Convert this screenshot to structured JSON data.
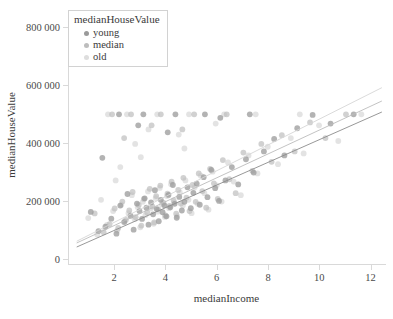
{
  "chart_data": {
    "type": "scatter",
    "title": "",
    "xlabel": "medianIncome",
    "ylabel": "medianHouseValue",
    "xlim": [
      0.2,
      12.6
    ],
    "ylim": [
      -20000,
      860000
    ],
    "xticks": [
      2,
      4,
      6,
      8,
      10,
      12
    ],
    "xticklabels": [
      "2",
      "4",
      "6",
      "8",
      "10",
      "12"
    ],
    "yticks": [
      0,
      200000,
      400000,
      600000,
      800000
    ],
    "yticklabels": [
      "0",
      "200 000",
      "400 000",
      "600 000",
      "800 000"
    ],
    "grid": false,
    "legend": {
      "title": "medianHouseValue",
      "position": "top-left",
      "entries": [
        {
          "label": "young",
          "color": "#9a9a9a"
        },
        {
          "label": "median",
          "color": "#bdbdbd"
        },
        {
          "label": "old",
          "color": "#dedede"
        }
      ]
    },
    "series": [
      {
        "name": "young",
        "color": "#9a9a9a",
        "opacity": 0.75,
        "trendline": {
          "x": [
            0.5,
            12.4
          ],
          "y": [
            42000,
            508000
          ],
          "color": "#8c8c8c"
        },
        "points": [
          [
            1.5,
            350000
          ],
          [
            1.05,
            163000
          ],
          [
            1.35,
            97000
          ],
          [
            1.62,
            112000
          ],
          [
            1.85,
            140000
          ],
          [
            2.05,
            88000
          ],
          [
            2.2,
            185000
          ],
          [
            2.35,
            128000
          ],
          [
            2.48,
            225000
          ],
          [
            2.6,
            150000
          ],
          [
            2.72,
            102000
          ],
          [
            2.85,
            192000
          ],
          [
            2.95,
            166000
          ],
          [
            3.05,
            139000
          ],
          [
            3.15,
            210000
          ],
          [
            3.22,
            178000
          ],
          [
            3.3,
            119000
          ],
          [
            3.4,
            196000
          ],
          [
            3.48,
            155000
          ],
          [
            3.55,
            238000
          ],
          [
            3.62,
            173000
          ],
          [
            3.7,
            131000
          ],
          [
            3.78,
            205000
          ],
          [
            3.85,
            162000
          ],
          [
            3.92,
            186000
          ],
          [
            4.0,
            148000
          ],
          [
            4.08,
            222000
          ],
          [
            4.15,
            179000
          ],
          [
            4.25,
            256000
          ],
          [
            4.32,
            191000
          ],
          [
            4.4,
            143000
          ],
          [
            4.5,
            215000
          ],
          [
            4.6,
            168000
          ],
          [
            4.7,
            198000
          ],
          [
            4.82,
            248000
          ],
          [
            4.95,
            176000
          ],
          [
            5.05,
            229000
          ],
          [
            5.18,
            261000
          ],
          [
            5.3,
            188000
          ],
          [
            5.45,
            283000
          ],
          [
            5.6,
            214000
          ],
          [
            5.75,
            308000
          ],
          [
            5.9,
            245000
          ],
          [
            6.05,
            201000
          ],
          [
            6.3,
            272000
          ],
          [
            6.55,
            318000
          ],
          [
            6.8,
            258000
          ],
          [
            7.1,
            345000
          ],
          [
            7.4,
            299000
          ],
          [
            7.8,
            372000
          ],
          [
            8.2,
            415000
          ],
          [
            8.6,
            358000
          ],
          [
            9.1,
            452000
          ],
          [
            9.7,
            498000
          ],
          [
            10.4,
            468000
          ],
          [
            11.3,
            500000
          ],
          [
            2.15,
            500000
          ],
          [
            3.1,
            500000
          ],
          [
            4.35,
            500000
          ],
          [
            5.5,
            500000
          ],
          [
            2.9,
            462000
          ],
          [
            4.05,
            438000
          ],
          [
            6.1,
            488000
          ],
          [
            7.25,
            500000
          ]
        ]
      },
      {
        "name": "median",
        "color": "#bdbdbd",
        "opacity": 0.7,
        "trendline": {
          "x": [
            0.5,
            12.4
          ],
          "y": [
            56000,
            546000
          ],
          "color": "#bcbcbc"
        },
        "points": [
          [
            1.2,
            158000
          ],
          [
            1.55,
            93000
          ],
          [
            1.78,
            121000
          ],
          [
            1.98,
            175000
          ],
          [
            2.12,
            108000
          ],
          [
            2.28,
            199000
          ],
          [
            2.42,
            136000
          ],
          [
            2.55,
            168000
          ],
          [
            2.68,
            232000
          ],
          [
            2.8,
            145000
          ],
          [
            2.92,
            187000
          ],
          [
            3.02,
            116000
          ],
          [
            3.12,
            208000
          ],
          [
            3.25,
            161000
          ],
          [
            3.35,
            243000
          ],
          [
            3.45,
            182000
          ],
          [
            3.52,
            127000
          ],
          [
            3.6,
            218000
          ],
          [
            3.68,
            172000
          ],
          [
            3.76,
            254000
          ],
          [
            3.88,
            195000
          ],
          [
            3.96,
            151000
          ],
          [
            4.04,
            226000
          ],
          [
            4.12,
            184000
          ],
          [
            4.2,
            268000
          ],
          [
            4.28,
            203000
          ],
          [
            4.38,
            157000
          ],
          [
            4.46,
            239000
          ],
          [
            4.56,
            192000
          ],
          [
            4.66,
            281000
          ],
          [
            4.78,
            212000
          ],
          [
            4.9,
            166000
          ],
          [
            5.02,
            256000
          ],
          [
            5.14,
            198000
          ],
          [
            5.26,
            296000
          ],
          [
            5.4,
            235000
          ],
          [
            5.55,
            178000
          ],
          [
            5.7,
            312000
          ],
          [
            5.85,
            262000
          ],
          [
            6.0,
            208000
          ],
          [
            6.2,
            342000
          ],
          [
            6.45,
            276000
          ],
          [
            6.7,
            228000
          ],
          [
            7.0,
            368000
          ],
          [
            7.35,
            305000
          ],
          [
            7.7,
            398000
          ],
          [
            8.1,
            336000
          ],
          [
            8.5,
            428000
          ],
          [
            9.0,
            372000
          ],
          [
            9.6,
            472000
          ],
          [
            10.2,
            418000
          ],
          [
            11.0,
            500000
          ],
          [
            1.88,
            500000
          ],
          [
            2.62,
            500000
          ],
          [
            3.78,
            500000
          ],
          [
            5.08,
            500000
          ],
          [
            6.35,
            500000
          ],
          [
            2.35,
            418000
          ],
          [
            3.42,
            462000
          ],
          [
            4.62,
            448000
          ]
        ]
      },
      {
        "name": "old",
        "color": "#dedede",
        "opacity": 0.85,
        "trendline": {
          "x": [
            0.5,
            12.4
          ],
          "y": [
            62000,
            592000
          ],
          "color": "#d6d6d6"
        },
        "points": [
          [
            0.95,
            142000
          ],
          [
            1.3,
            85000
          ],
          [
            1.68,
            118000
          ],
          [
            1.92,
            166000
          ],
          [
            2.08,
            99000
          ],
          [
            2.24,
            188000
          ],
          [
            2.38,
            131000
          ],
          [
            2.52,
            159000
          ],
          [
            2.65,
            221000
          ],
          [
            2.76,
            138000
          ],
          [
            2.88,
            179000
          ],
          [
            2.98,
            110000
          ],
          [
            3.08,
            198000
          ],
          [
            3.18,
            152000
          ],
          [
            3.28,
            234000
          ],
          [
            3.38,
            175000
          ],
          [
            3.5,
            122000
          ],
          [
            3.58,
            211000
          ],
          [
            3.66,
            164000
          ],
          [
            3.74,
            246000
          ],
          [
            3.82,
            189000
          ],
          [
            3.94,
            146000
          ],
          [
            4.02,
            218000
          ],
          [
            4.1,
            176000
          ],
          [
            4.18,
            259000
          ],
          [
            4.3,
            196000
          ],
          [
            4.42,
            149000
          ],
          [
            4.52,
            231000
          ],
          [
            4.64,
            185000
          ],
          [
            4.74,
            272000
          ],
          [
            4.86,
            205000
          ],
          [
            4.98,
            159000
          ],
          [
            5.1,
            248000
          ],
          [
            5.22,
            191000
          ],
          [
            5.34,
            288000
          ],
          [
            5.48,
            228000
          ],
          [
            5.64,
            171000
          ],
          [
            5.8,
            302000
          ],
          [
            5.96,
            255000
          ],
          [
            6.15,
            199000
          ],
          [
            6.4,
            334000
          ],
          [
            6.62,
            268000
          ],
          [
            6.9,
            221000
          ],
          [
            7.2,
            358000
          ],
          [
            7.55,
            296000
          ],
          [
            7.95,
            388000
          ],
          [
            8.35,
            328000
          ],
          [
            8.85,
            418000
          ],
          [
            9.35,
            365000
          ],
          [
            9.95,
            462000
          ],
          [
            10.7,
            408000
          ],
          [
            11.6,
            500000
          ],
          [
            1.72,
            500000
          ],
          [
            2.46,
            500000
          ],
          [
            3.64,
            500000
          ],
          [
            4.88,
            500000
          ],
          [
            6.25,
            500000
          ],
          [
            7.48,
            500000
          ],
          [
            9.2,
            500000
          ],
          [
            2.78,
            398000
          ],
          [
            3.3,
            448000
          ],
          [
            4.48,
            430000
          ],
          [
            5.92,
            468000
          ],
          [
            2.02,
            272000
          ],
          [
            1.45,
            205000
          ],
          [
            2.2,
            318000
          ],
          [
            3.0,
            352000
          ],
          [
            4.7,
            382000
          ]
        ]
      }
    ]
  }
}
